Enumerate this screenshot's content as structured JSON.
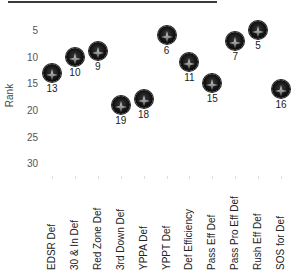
{
  "chart_data": {
    "type": "scatter",
    "title": "",
    "xlabel": "",
    "ylabel": "Rank",
    "ylim": [
      1,
      34
    ],
    "y_inverted": true,
    "yticks": [
      5,
      10,
      15,
      20,
      25,
      30
    ],
    "grid": false,
    "legend": null,
    "categories": [
      "EDSR Def",
      "30 & In Def",
      "Red Zone Def",
      "3rd Down Def",
      "YPPA Def",
      "YPPT Def",
      "Def Efficiency",
      "Pass Eff Def",
      "Pass Pro Eff Def",
      "Rush Eff Def",
      "SOS for Def"
    ],
    "values": [
      13,
      10,
      9,
      19,
      18,
      6,
      11,
      15,
      7,
      5,
      16
    ],
    "data_labels": [
      "13",
      "10",
      "9",
      "19",
      "18",
      "6",
      "11",
      "15",
      "7",
      "5",
      "16"
    ],
    "marker_color": "#000000",
    "marker_highlight": "#9a9a9a"
  },
  "axis": {
    "ylabel": "Rank",
    "yticks": [
      "5",
      "10",
      "15",
      "20",
      "25",
      "30"
    ]
  }
}
